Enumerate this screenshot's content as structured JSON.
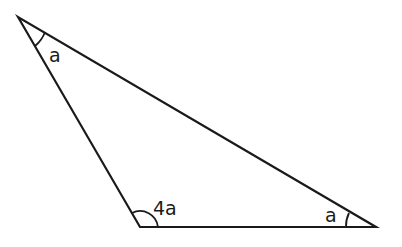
{
  "diagram": {
    "type": "triangle",
    "stroke_color": "#1a1a1a",
    "background": "#ffffff",
    "vertices": [
      {
        "id": "top-left",
        "x": 18,
        "y": 17
      },
      {
        "id": "bottom-left",
        "x": 140,
        "y": 227
      },
      {
        "id": "bottom-right",
        "x": 376,
        "y": 227
      }
    ],
    "angles": [
      {
        "vertex": "top-left",
        "label": "a"
      },
      {
        "vertex": "bottom-left",
        "label": "4a"
      },
      {
        "vertex": "bottom-right",
        "label": "a"
      }
    ]
  }
}
